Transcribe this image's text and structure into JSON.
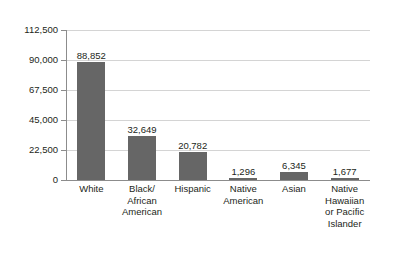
{
  "chart_data": {
    "type": "bar",
    "title": "",
    "subtitle": "",
    "xlabel": "",
    "ylabel": "",
    "ylim": [
      0,
      112500
    ],
    "grid": true,
    "legend": false,
    "legend_position": "none",
    "bar_color": "#666666",
    "gridline_color": "#d4d4d4",
    "axis_color": "#8c8c8c",
    "text_color": "#231f20",
    "y_ticks": [
      0,
      22500,
      45000,
      67500,
      90000,
      112500
    ],
    "y_tick_labels": [
      "0",
      "22,500",
      "45,000",
      "67,500",
      "90,000",
      "112,500"
    ],
    "categories": [
      "White",
      "Black/ African American",
      "Hispanic",
      "Native American",
      "Asian",
      "Native Hawaiian or Pacific Islander"
    ],
    "category_lines": [
      [
        "White"
      ],
      [
        "Black/",
        "African",
        "American"
      ],
      [
        "Hispanic"
      ],
      [
        "Native",
        "American"
      ],
      [
        "Asian"
      ],
      [
        "Native",
        "Hawaiian",
        "or Pacific",
        "Islander"
      ]
    ],
    "values": [
      88852,
      32649,
      20782,
      1296,
      6345,
      1677
    ],
    "value_labels": [
      "88,852",
      "32,649",
      "20,782",
      "1,296",
      "6,345",
      "1,677"
    ]
  }
}
